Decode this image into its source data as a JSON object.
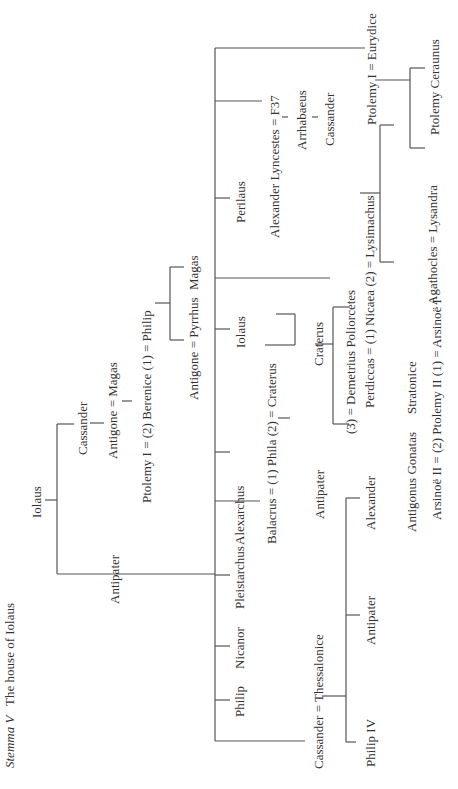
{
  "title": {
    "label": "Stemma V",
    "text": "The house of Iolaus"
  },
  "nodes": {
    "iolaus_root": "Iolaus",
    "cassander_son": "Cassander",
    "antipater": "Antipater",
    "antigone_magas": "Antigone = Magas",
    "ptolemy_berenice_philip": "Ptolemy I = (2) Berenice (1) = Philip",
    "antigone_pyrrhus": "Antigone = Pyrrhus",
    "magas": "Magas",
    "philip": "Philip",
    "nicanor": "Nicanor",
    "pleistarchus": "Pleistarchus",
    "alexarchus": "Alexarchus",
    "iolaus_son": "Iolaus",
    "perilaus": "Perilaus",
    "alexander_lyncestes": "Alexander Lyncestes = F37",
    "arrhabaeus": "Arrhabaeus",
    "cassander_lyncestes": "Cassander",
    "ptolemy_eurydice": "Ptolemy I = Eurydice",
    "lysandra": "Lysandra",
    "ptolemy_ceraunus": "Ptolemy Ceraunus",
    "balacrus_phila_craterus": "Balacrus = (1) Phila (2) = Craterus",
    "antipater_gs": "Antipater",
    "craterus_gs": "Craterus",
    "demetrius": "(3) = Demetrius Poliorcetes",
    "perdiccas_nicaea_lysimachus": "Perdiccas = (1) Nicaea (2) = Lysimachus",
    "agathocles_lysandra": "Agathocles = Lysandra",
    "cassander_thessalonice": "Cassander = Thessalonice",
    "philip_iv": "Philip IV",
    "antipater_cass": "Antipater",
    "alexander_cass": "Alexander",
    "antigonus_gonatas": "Antigonus Gonatas",
    "stratonice": "Stratonice",
    "arsinoe_ptolemy": "Arsinoë II = (2) Ptolemy II (1) = Arsinoë I"
  }
}
